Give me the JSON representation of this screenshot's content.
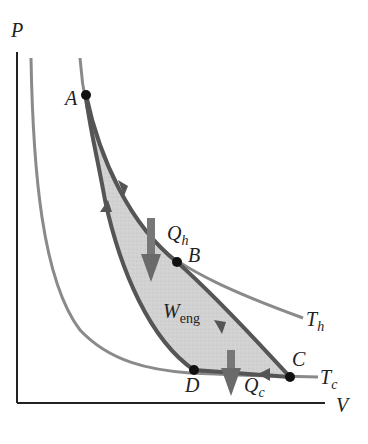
{
  "diagram": {
    "type": "PV diagram - Carnot cycle",
    "axes": {
      "y_label": "P",
      "x_label": "V"
    },
    "points": [
      {
        "name": "A",
        "label": "A"
      },
      {
        "name": "B",
        "label": "B"
      },
      {
        "name": "C",
        "label": "C"
      },
      {
        "name": "D",
        "label": "D"
      }
    ],
    "isotherms": {
      "hot": {
        "label": "T",
        "sub": "h"
      },
      "cold": {
        "label": "T",
        "sub": "c"
      }
    },
    "heat_in": {
      "label": "Q",
      "sub": "h"
    },
    "heat_out": {
      "label": "Q",
      "sub": "c"
    },
    "work": {
      "label": "W",
      "sub": "eng"
    },
    "colors": {
      "axis": "#222222",
      "isotherm": "#8a8a8a",
      "cycle": "#555555",
      "fill": "#cfcfcf",
      "point": "#111111",
      "arrow": "#6a6a6a"
    }
  }
}
